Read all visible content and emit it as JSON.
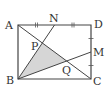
{
  "diagram": {
    "title": "",
    "colors": {
      "line": "#444444",
      "shade": "#d6d6d6",
      "text": "#333333",
      "background": "#ffffff"
    },
    "points": {
      "A": {
        "label": "A",
        "x": 18,
        "y": 25
      },
      "B": {
        "label": "B",
        "x": 18,
        "y": 79
      },
      "C": {
        "label": "C",
        "x": 91,
        "y": 79
      },
      "D": {
        "label": "D",
        "x": 91,
        "y": 25
      },
      "N": {
        "label": "N",
        "x": 54.5,
        "y": 25
      },
      "M": {
        "label": "M",
        "x": 91,
        "y": 52
      },
      "P": {
        "label": "P",
        "x": 42.3,
        "y": 43
      },
      "Q": {
        "label": "Q",
        "x": 66.7,
        "y": 61
      }
    },
    "segments": [
      "AB",
      "BC",
      "CD",
      "DA",
      "AC",
      "BN",
      "BM"
    ],
    "shaded_region": "triangle BPQ",
    "equal_marks": [
      {
        "segments": [
          "AN",
          "ND"
        ],
        "mark": "double-tick"
      },
      {
        "segments": [
          "DM",
          "MC"
        ],
        "mark": "single-tick"
      }
    ]
  }
}
